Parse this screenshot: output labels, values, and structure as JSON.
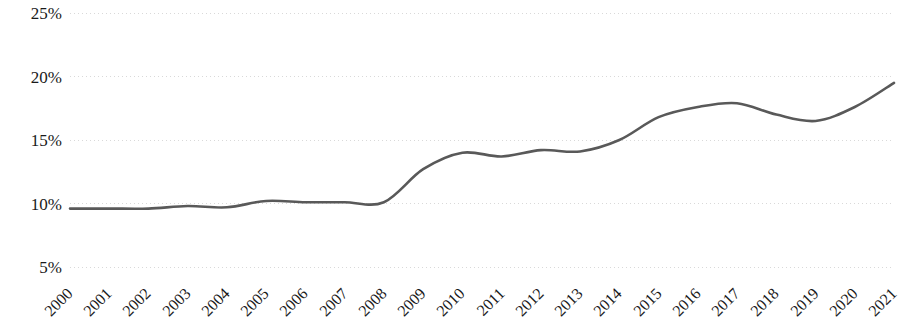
{
  "chart_data": {
    "type": "line",
    "title": "",
    "subtitle": "",
    "xlabel": "",
    "ylabel": "",
    "categories": [
      "2000",
      "2001",
      "2002",
      "2003",
      "2004",
      "2005",
      "2006",
      "2007",
      "2008",
      "2009",
      "2010",
      "2011",
      "2012",
      "2013",
      "2014",
      "2015",
      "2016",
      "2017",
      "2018",
      "2019",
      "2020",
      "2021"
    ],
    "series": [
      {
        "name": "",
        "values": [
          9.6,
          9.6,
          9.6,
          9.8,
          9.7,
          10.2,
          10.1,
          10.1,
          10.1,
          12.7,
          14.0,
          13.7,
          14.2,
          14.1,
          15.0,
          16.8,
          17.6,
          17.9,
          17.0,
          16.5,
          17.6,
          19.5
        ]
      }
    ],
    "y_ticks": [
      "5%",
      "10%",
      "15%",
      "20%",
      "25%"
    ],
    "y_tick_values": [
      5,
      10,
      15,
      20,
      25
    ],
    "ylim": [
      5,
      25
    ],
    "grid": "horizontal-dotted",
    "legend": "none",
    "line_color": "#595959",
    "grid_color": "#d9d9d9",
    "text_color": "#1a1a1a",
    "x_label_rotation": -45,
    "smoothing": "spline"
  }
}
